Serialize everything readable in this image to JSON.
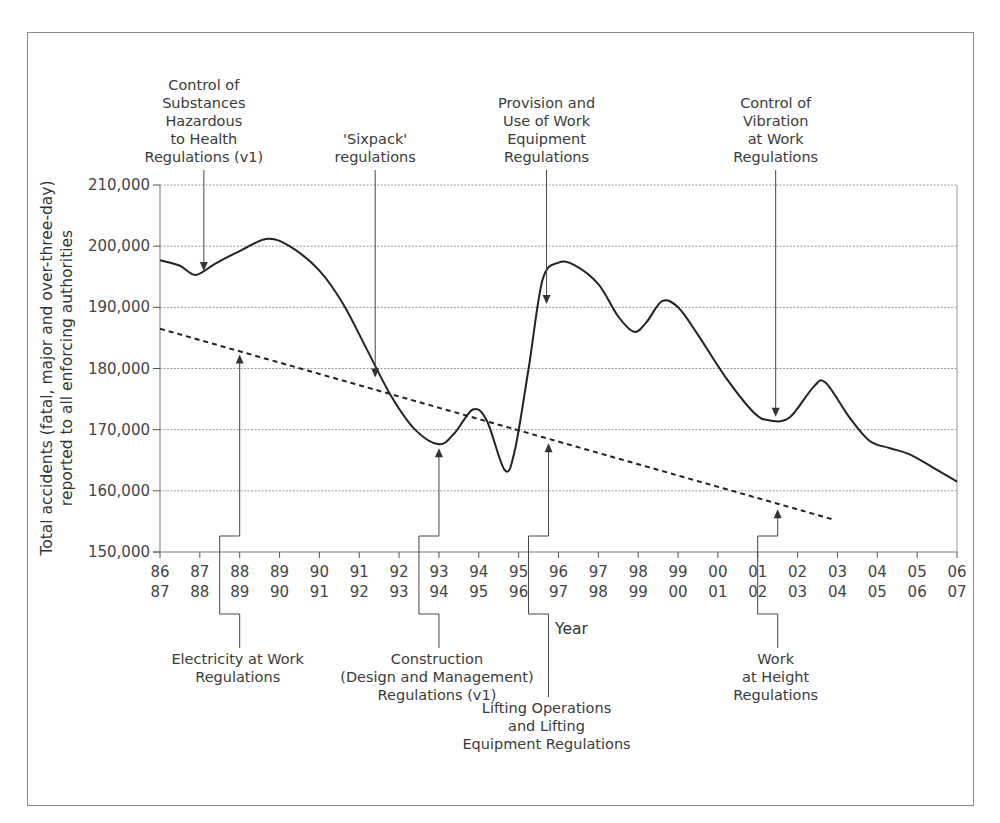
{
  "chart_data": {
    "type": "line",
    "title": "",
    "xlabel": "Year",
    "ylabel": "Total accidents (fatal, major and over-three-day) reported to all enforcing authorities",
    "ylabel_lines": [
      "Total accidents (fatal, major and over-three-day)",
      "reported to all enforcing authorities"
    ],
    "ylim": [
      150000,
      210000
    ],
    "y_ticks": [
      150000,
      160000,
      170000,
      180000,
      190000,
      200000,
      210000
    ],
    "y_tick_labels": [
      "150,000",
      "160,000",
      "170,000",
      "180,000",
      "190,000",
      "200,000",
      "210,000"
    ],
    "grid": true,
    "categories": [
      [
        "86",
        "87"
      ],
      [
        "87",
        "88"
      ],
      [
        "88",
        "89"
      ],
      [
        "89",
        "90"
      ],
      [
        "90",
        "91"
      ],
      [
        "91",
        "92"
      ],
      [
        "92",
        "93"
      ],
      [
        "93",
        "94"
      ],
      [
        "94",
        "95"
      ],
      [
        "95",
        "96"
      ],
      [
        "96",
        "97"
      ],
      [
        "97",
        "98"
      ],
      [
        "98",
        "99"
      ],
      [
        "99",
        "00"
      ],
      [
        "00",
        "01"
      ],
      [
        "01",
        "02"
      ],
      [
        "02",
        "03"
      ],
      [
        "03",
        "04"
      ],
      [
        "04",
        "05"
      ],
      [
        "05",
        "06"
      ],
      [
        "06",
        "07"
      ]
    ],
    "series": [
      {
        "name": "Total accidents",
        "style": "solid",
        "points": [
          [
            0,
            197700
          ],
          [
            0.5,
            196800
          ],
          [
            0.9,
            195300
          ],
          [
            1.4,
            197200
          ],
          [
            2.0,
            199200
          ],
          [
            2.7,
            201200
          ],
          [
            3.3,
            199800
          ],
          [
            4.0,
            196000
          ],
          [
            4.6,
            190500
          ],
          [
            5.2,
            183000
          ],
          [
            5.8,
            175500
          ],
          [
            6.4,
            170000
          ],
          [
            7.0,
            167600
          ],
          [
            7.4,
            169500
          ],
          [
            7.85,
            173300
          ],
          [
            8.2,
            171500
          ],
          [
            8.65,
            163400
          ],
          [
            8.9,
            166500
          ],
          [
            9.25,
            180000
          ],
          [
            9.6,
            194500
          ],
          [
            10.0,
            197300
          ],
          [
            10.4,
            196900
          ],
          [
            11.0,
            193800
          ],
          [
            11.5,
            188500
          ],
          [
            11.9,
            186000
          ],
          [
            12.2,
            187500
          ],
          [
            12.6,
            191000
          ],
          [
            13.0,
            190000
          ],
          [
            13.5,
            185500
          ],
          [
            14.2,
            178500
          ],
          [
            14.9,
            172800
          ],
          [
            15.3,
            171500
          ],
          [
            15.8,
            172000
          ],
          [
            16.4,
            177000
          ],
          [
            16.7,
            177700
          ],
          [
            17.3,
            172000
          ],
          [
            17.8,
            168200
          ],
          [
            18.3,
            167000
          ],
          [
            18.8,
            166000
          ],
          [
            19.4,
            163800
          ],
          [
            20.0,
            161500
          ]
        ]
      },
      {
        "name": "Trend",
        "style": "dashed",
        "points": [
          [
            0,
            186500
          ],
          [
            16.85,
            155400
          ]
        ]
      }
    ],
    "annotations": [
      {
        "text": [
          "Control of",
          "Substances",
          "Hazardous",
          "to Health",
          "Regulations (v1)"
        ],
        "position": "top",
        "x": 1.1,
        "y": 195600
      },
      {
        "text": [
          "'Sixpack'",
          "regulations"
        ],
        "position": "top",
        "x": 5.4,
        "y": 178200
      },
      {
        "text": [
          "Provision and",
          "Use of Work",
          "Equipment",
          "Regulations"
        ],
        "position": "top",
        "x": 9.7,
        "y": 190200
      },
      {
        "text": [
          "Control of",
          "Vibration",
          "at Work",
          "Regulations"
        ],
        "position": "top",
        "x": 15.45,
        "y": 171800
      },
      {
        "text": [
          "Electricity at Work",
          "Regulations"
        ],
        "position": "bottom",
        "x": 2.0,
        "y": 182600
      },
      {
        "text": [
          "Construction",
          "(Design and Management)",
          "Regulations (v1)"
        ],
        "position": "bottom",
        "x": 7.0,
        "y": 167300
      },
      {
        "text": [
          "Lifting Operations",
          "and Lifting",
          "Equipment Regulations"
        ],
        "position": "bottom",
        "x": 9.75,
        "y": 168100
      },
      {
        "text": [
          "Work",
          "at Height",
          "Regulations"
        ],
        "position": "bottom",
        "x": 15.5,
        "y": 157300
      }
    ]
  }
}
